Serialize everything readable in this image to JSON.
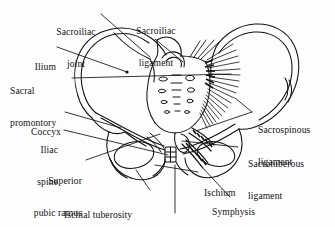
{
  "figure": {
    "background_color": "#fdfdfd",
    "ink_color": "#121212",
    "width": 335,
    "height": 227
  },
  "labels": {
    "sacroiliac_joint": {
      "line1": "Sacroiliac",
      "line2": "joint"
    },
    "ilium": {
      "line1": "Ilium"
    },
    "sacral_promontory": {
      "line1": "Sacral",
      "line2": "promontory"
    },
    "sacroiliac_ligament": {
      "line1": "Sacroiliac",
      "line2": "ligament"
    },
    "coccyx": {
      "line1": "Coccyx"
    },
    "iliac_spine": {
      "line1": "Iliac",
      "line2": "spine"
    },
    "superior_pubic_ramus": {
      "line1": "Superior",
      "line2": "pubic ramus"
    },
    "ischial_tuberosity": {
      "line1": "Ischial tuberosity"
    },
    "pubic_arch": {
      "line1": "Pubic arch"
    },
    "symphysis_pubis": {
      "line1": "Symphysis",
      "line2": "pubis"
    },
    "ischium": {
      "line1": "Ischium"
    },
    "sacrospinous_ligament": {
      "line1": "Sacrospinous",
      "line2": "ligament"
    },
    "sacrotuberous_ligament": {
      "line1": "Sacrotuberous",
      "line2": "ligament"
    }
  }
}
